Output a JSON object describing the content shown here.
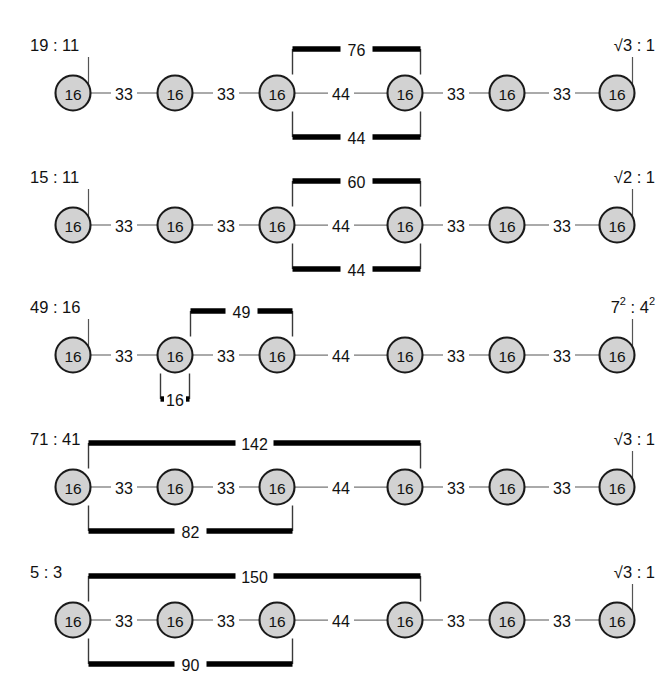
{
  "figure": {
    "node_value": "16",
    "node_count_per_row": 6,
    "colors": {
      "node_fill": "#d2d2d2",
      "node_stroke": "#1a1a1a",
      "edge": "#777777",
      "bracket": "#000000",
      "background": "#ffffff"
    }
  },
  "chart_data": {
    "type": "diagram",
    "title": "",
    "rows": [
      {
        "ratio_left": "19 : 11",
        "ratio_right_text": "√3 : 1",
        "ratio_right_base": "√3",
        "ratio_right_sup": "",
        "ratio_right_base2": "1",
        "ratio_right_sup2": "",
        "nodes": [
          "16",
          "16",
          "16",
          "16",
          "16",
          "16"
        ],
        "edges": [
          "33",
          "33",
          "44",
          "33",
          "33"
        ],
        "tick_nodes": [
          0,
          5
        ],
        "brackets": [
          {
            "label": "76",
            "from": 2,
            "to": 3,
            "side": "top"
          },
          {
            "label": "44",
            "from": 2,
            "to": 3,
            "side": "bottom"
          }
        ]
      },
      {
        "ratio_left": "15 : 11",
        "ratio_right_text": "√2 : 1",
        "ratio_right_base": "√2",
        "ratio_right_sup": "",
        "ratio_right_base2": "1",
        "ratio_right_sup2": "",
        "nodes": [
          "16",
          "16",
          "16",
          "16",
          "16",
          "16"
        ],
        "edges": [
          "33",
          "33",
          "44",
          "33",
          "33"
        ],
        "tick_nodes": [
          0,
          5
        ],
        "brackets": [
          {
            "label": "60",
            "from": 2,
            "to": 3,
            "side": "top"
          },
          {
            "label": "44",
            "from": 2,
            "to": 3,
            "side": "bottom"
          }
        ]
      },
      {
        "ratio_left": "49 : 16",
        "ratio_right_text": "7² : 4²",
        "ratio_right_base": "7",
        "ratio_right_sup": "2",
        "ratio_right_base2": "4",
        "ratio_right_sup2": "2",
        "nodes": [
          "16",
          "16",
          "16",
          "16",
          "16",
          "16"
        ],
        "edges": [
          "33",
          "33",
          "44",
          "33",
          "33"
        ],
        "tick_nodes": [
          0,
          5
        ],
        "brackets": [
          {
            "label": "49",
            "from": 1,
            "to": 2,
            "side": "top"
          },
          {
            "label": "16",
            "from": 1,
            "to": 1,
            "side": "bottom"
          }
        ]
      },
      {
        "ratio_left": "71 : 41",
        "ratio_right_text": "√3 : 1",
        "ratio_right_base": "√3",
        "ratio_right_sup": "",
        "ratio_right_base2": "1",
        "ratio_right_sup2": "",
        "nodes": [
          "16",
          "16",
          "16",
          "16",
          "16",
          "16"
        ],
        "edges": [
          "33",
          "33",
          "44",
          "33",
          "33"
        ],
        "tick_nodes": [
          5
        ],
        "brackets": [
          {
            "label": "142",
            "from": 0,
            "to": 3,
            "side": "top"
          },
          {
            "label": "82",
            "from": 0,
            "to": 2,
            "side": "bottom"
          }
        ]
      },
      {
        "ratio_left": "5 : 3",
        "ratio_right_text": "√3 : 1",
        "ratio_right_base": "√3",
        "ratio_right_sup": "",
        "ratio_right_base2": "1",
        "ratio_right_sup2": "",
        "nodes": [
          "16",
          "16",
          "16",
          "16",
          "16",
          "16"
        ],
        "edges": [
          "33",
          "33",
          "44",
          "33",
          "33"
        ],
        "tick_nodes": [
          5
        ],
        "brackets": [
          {
            "label": "150",
            "from": 0,
            "to": 3,
            "side": "top"
          },
          {
            "label": "90",
            "from": 0,
            "to": 2,
            "side": "bottom"
          }
        ]
      }
    ]
  }
}
